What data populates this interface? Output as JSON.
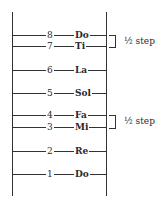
{
  "diagram": {
    "scale": [
      {
        "degree": "8",
        "syllable": "Do",
        "y": 35
      },
      {
        "degree": "7",
        "syllable": "Ti",
        "y": 46
      },
      {
        "degree": "6",
        "syllable": "La",
        "y": 70
      },
      {
        "degree": "5",
        "syllable": "Sol",
        "y": 93
      },
      {
        "degree": "4",
        "syllable": "Fa",
        "y": 115
      },
      {
        "degree": "3",
        "syllable": "Mi",
        "y": 127
      },
      {
        "degree": "2",
        "syllable": "Re",
        "y": 151
      },
      {
        "degree": "1",
        "syllable": "Do",
        "y": 174
      }
    ],
    "half_steps": [
      {
        "label": "½ step",
        "between": [
          "Ti",
          "Do"
        ]
      },
      {
        "label": "½ step",
        "between": [
          "Mi",
          "Fa"
        ]
      }
    ]
  }
}
